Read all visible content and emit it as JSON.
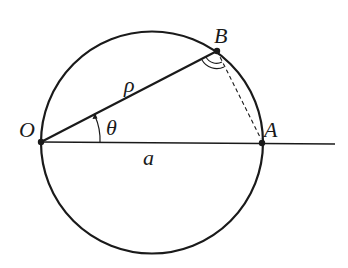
{
  "diagram": {
    "type": "geometry",
    "colors": {
      "stroke": "#1a1a1a",
      "background": "#ffffff"
    },
    "points": {
      "O": {
        "label": "O",
        "x": 41,
        "y": 142
      },
      "A": {
        "label": "A",
        "x": 262,
        "y": 143
      },
      "B": {
        "label": "B",
        "x": 217,
        "y": 51
      }
    },
    "circle": {
      "cx": 152,
      "cy": 142.5,
      "r": 111
    },
    "labels": {
      "O": "O",
      "A": "A",
      "B": "B",
      "rho": "ρ",
      "theta": "θ",
      "a": "a"
    },
    "segments": [
      {
        "from": "O",
        "to": "B",
        "label": "ρ",
        "style": "solid"
      },
      {
        "from": "O",
        "to": "A",
        "label": "a",
        "style": "solid",
        "extends_beyond_A": true
      },
      {
        "from": "B",
        "to": "A",
        "style": "dashed"
      }
    ],
    "angles": [
      {
        "vertex": "O",
        "label": "θ",
        "marker": "arc-with-arrow"
      },
      {
        "vertex": "B",
        "marker": "double-arc"
      }
    ]
  }
}
